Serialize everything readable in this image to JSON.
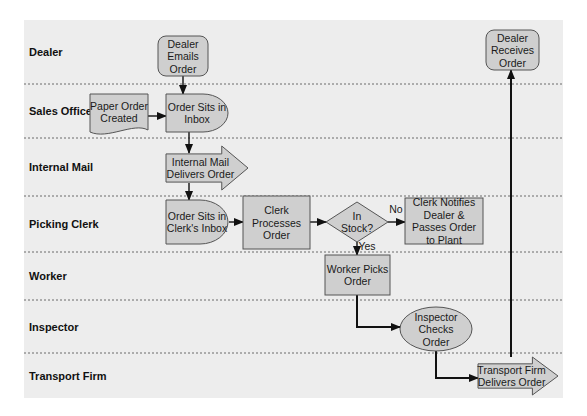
{
  "diagram": {
    "type": "swimlane-flowchart",
    "colors": {
      "background": "#ededed",
      "node_fill": "#cfcfcf",
      "node_stroke": "#555555",
      "lane_divider": "#6a6a6a",
      "edge": "#111111"
    },
    "lanes": [
      {
        "id": "dealer",
        "label": "Dealer"
      },
      {
        "id": "sales",
        "label": "Sales Office"
      },
      {
        "id": "mail",
        "label": "Internal Mail"
      },
      {
        "id": "clerk",
        "label": "Picking Clerk"
      },
      {
        "id": "worker",
        "label": "Worker"
      },
      {
        "id": "inspector",
        "label": "Inspector"
      },
      {
        "id": "transport",
        "label": "Transport Firm"
      }
    ],
    "nodes": [
      {
        "id": "n1",
        "lane": "dealer",
        "shape": "rounded-rect",
        "lines": [
          "Dealer",
          "Emails",
          "Order"
        ]
      },
      {
        "id": "n2",
        "lane": "sales",
        "shape": "document",
        "lines": [
          "Paper Order",
          "Created"
        ]
      },
      {
        "id": "n3",
        "lane": "sales",
        "shape": "delay",
        "lines": [
          "Order Sits in",
          "Inbox"
        ]
      },
      {
        "id": "n4",
        "lane": "mail",
        "shape": "arrow",
        "lines": [
          "Internal Mail",
          "Delivers Order"
        ]
      },
      {
        "id": "n5",
        "lane": "clerk",
        "shape": "delay",
        "lines": [
          "Order Sits in",
          "Clerk's Inbox"
        ]
      },
      {
        "id": "n6",
        "lane": "clerk",
        "shape": "rect",
        "lines": [
          "Clerk",
          "Processes",
          "Order"
        ]
      },
      {
        "id": "n7",
        "lane": "clerk",
        "shape": "diamond",
        "lines": [
          "In",
          "Stock?"
        ]
      },
      {
        "id": "n8",
        "lane": "clerk",
        "shape": "rect",
        "lines": [
          "Clerk Notifies",
          "Dealer &",
          "Passes Order",
          "to Plant"
        ]
      },
      {
        "id": "n9",
        "lane": "worker",
        "shape": "rect",
        "lines": [
          "Worker Picks",
          "Order"
        ]
      },
      {
        "id": "n10",
        "lane": "inspector",
        "shape": "ellipse",
        "lines": [
          "Inspector",
          "Checks",
          "Order"
        ]
      },
      {
        "id": "n11",
        "lane": "transport",
        "shape": "arrow",
        "lines": [
          "Transport Firm",
          "Delivers Order"
        ]
      },
      {
        "id": "n12",
        "lane": "dealer",
        "shape": "rounded-rect",
        "lines": [
          "Dealer",
          "Receives",
          "Order"
        ]
      }
    ],
    "edges": [
      {
        "from": "n1",
        "to": "n2",
        "label": ""
      },
      {
        "from": "n2",
        "to": "n3",
        "label": ""
      },
      {
        "from": "n3",
        "to": "n4",
        "label": ""
      },
      {
        "from": "n4",
        "to": "n5",
        "label": ""
      },
      {
        "from": "n5",
        "to": "n6",
        "label": ""
      },
      {
        "from": "n6",
        "to": "n7",
        "label": ""
      },
      {
        "from": "n7",
        "to": "n8",
        "label": "No"
      },
      {
        "from": "n7",
        "to": "n9",
        "label": "Yes"
      },
      {
        "from": "n9",
        "to": "n10",
        "label": ""
      },
      {
        "from": "n10",
        "to": "n11",
        "label": ""
      },
      {
        "from": "n11",
        "to": "n12",
        "label": ""
      }
    ]
  }
}
